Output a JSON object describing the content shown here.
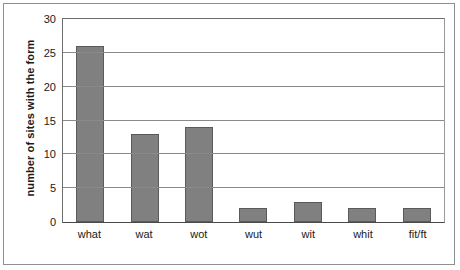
{
  "chart_data": {
    "type": "bar",
    "title": "",
    "subtitle": "",
    "xlabel": "",
    "ylabel": "number of sites with the form",
    "categories": [
      "what",
      "wat",
      "wot",
      "wut",
      "wit",
      "whit",
      "fit/ft"
    ],
    "values": [
      26,
      13,
      14,
      2,
      3,
      2,
      2
    ],
    "ylim": [
      0,
      30
    ],
    "yticks": [
      0,
      5,
      10,
      15,
      20,
      25,
      30
    ],
    "ytick_labels": [
      "0",
      "5",
      "10",
      "15",
      "20",
      "25",
      "30"
    ],
    "grid": "horizontal",
    "legend": "none",
    "series": [
      {
        "name": "number of sites with the form",
        "values": [
          26,
          13,
          14,
          2,
          3,
          2,
          2
        ]
      }
    ],
    "colors": {
      "bar_fill": "#808080",
      "bar_stroke": "#5a5a5a",
      "gridline": "#8a8a8a",
      "axis": "#4a4a4a",
      "text": "#1a1a1a",
      "background": "#ffffff",
      "frame": "#8e8e8e"
    }
  }
}
